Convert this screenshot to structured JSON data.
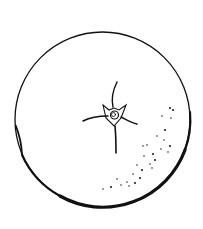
{
  "illustration": {
    "subject": "orange-fruit-line-drawing",
    "background": "#ffffff",
    "stroke_color": "#111111",
    "outline": {
      "cx": 102.5,
      "cy": 119.5,
      "r": 87.5
    },
    "navel": {
      "cx": 114,
      "cy": 114
    },
    "speckles": [
      [
        170,
        108
      ],
      [
        162,
        116
      ],
      [
        171,
        118
      ],
      [
        165,
        130
      ],
      [
        157,
        136
      ],
      [
        164,
        140
      ],
      [
        170,
        146
      ],
      [
        147,
        145
      ],
      [
        161,
        149
      ],
      [
        153,
        154
      ],
      [
        168,
        152
      ],
      [
        144,
        156
      ],
      [
        155,
        160
      ],
      [
        137,
        165
      ],
      [
        150,
        164
      ],
      [
        142,
        170
      ],
      [
        152,
        168
      ],
      [
        133,
        174
      ],
      [
        140,
        178
      ],
      [
        117,
        179
      ],
      [
        127,
        182
      ],
      [
        135,
        183
      ],
      [
        121,
        185
      ],
      [
        129,
        186
      ],
      [
        111,
        187
      ],
      [
        103,
        189
      ],
      [
        143,
        146
      ],
      [
        173,
        110
      ]
    ]
  }
}
